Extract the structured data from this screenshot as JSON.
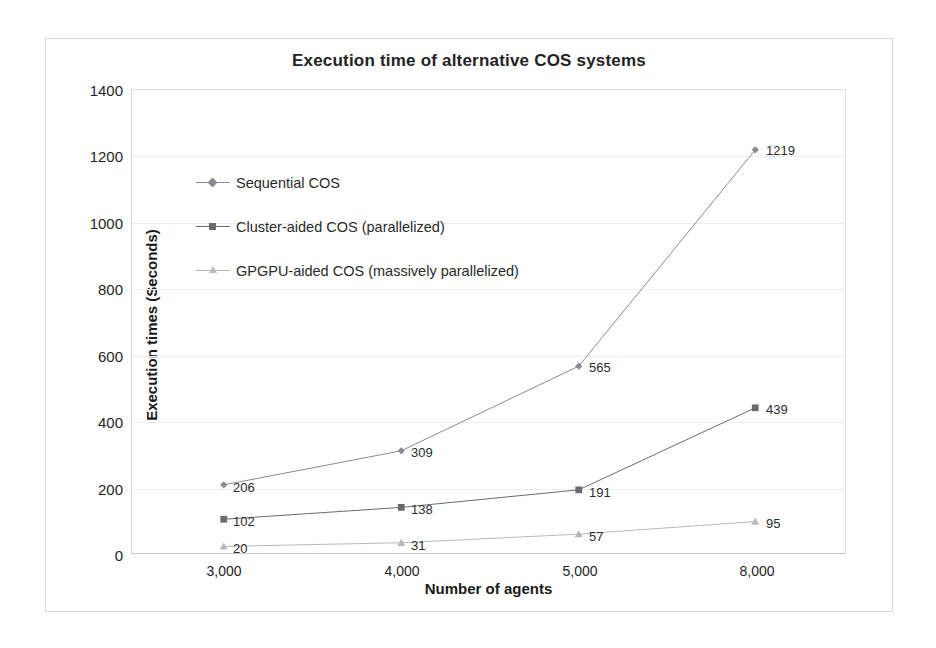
{
  "chart_data": {
    "type": "line",
    "title": "Execution time of alternative COS systems",
    "xlabel": "Number of agents",
    "ylabel": "Execution times (Seconds)",
    "categories": [
      "3,000",
      "4,000",
      "5,000",
      "8,000"
    ],
    "ylim": [
      0,
      1400
    ],
    "ytick_labels": [
      "0",
      "200",
      "400",
      "600",
      "800",
      "1000",
      "1200",
      "1400"
    ],
    "yticks": [
      0,
      200,
      400,
      600,
      800,
      1000,
      1200,
      1400
    ],
    "grid": true,
    "legend_position": "inside-upper-left",
    "series": [
      {
        "name": "Sequential COS",
        "marker": "diamond",
        "color": "#8a8a94",
        "values": [
          206,
          309,
          565,
          1219
        ],
        "labels": [
          "206",
          "309",
          "565",
          "1219"
        ]
      },
      {
        "name": "Cluster-aided COS (parallelized)",
        "marker": "square",
        "color": "#6b6b6b",
        "values": [
          102,
          138,
          191,
          439
        ],
        "labels": [
          "102",
          "138",
          "191",
          "439"
        ]
      },
      {
        "name": "GPGPU-aided COS (massively parallelized)",
        "marker": "triangle",
        "color": "#b9b9bd",
        "values": [
          20,
          31,
          57,
          95
        ],
        "labels": [
          "20",
          "31",
          "57",
          "95"
        ]
      }
    ]
  },
  "figure": {
    "border_color": "#d8d8d8",
    "background": "#ffffff",
    "gridline_color": "#ececec"
  }
}
